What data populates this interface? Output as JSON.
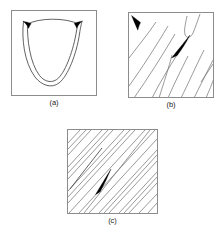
{
  "figure": {
    "title": "",
    "background_color": "#ffffff",
    "frame_color": "#8c8c8c",
    "line_color": "#3a3a3a",
    "cusp_color": "#000000",
    "panels": [
      {
        "id": "a",
        "caption": "(a)",
        "description": "Square frame containing a U-shaped caustic curve with two filled cusp spikes at the upper left and upper right, joined by a shallow arc across the top",
        "features": {
          "cusp_count": 2,
          "curve_count": 1,
          "shape": "u-shaped-caustic"
        }
      },
      {
        "id": "b",
        "caption": "(b)",
        "description": "Square frame filled with a family of slanted lines running lower-left to upper-right, a hairpin turn near the top right, a filled cusp wedge in the upper-left corner and a larger filled cusp wedge near the centre",
        "features": {
          "cusp_count": 2,
          "line_count": 9,
          "shape": "line-family-with-cusps"
        }
      },
      {
        "id": "c",
        "caption": "(c)",
        "description": "Square frame densely filled with parallel diagonal lines running lower-left to upper-right, with a short filled cusp wedge near the centre-left and a darker emphasised line at the upper left",
        "features": {
          "cusp_count": 1,
          "line_count": 21,
          "shape": "dense-parallel-hatching"
        }
      }
    ]
  }
}
